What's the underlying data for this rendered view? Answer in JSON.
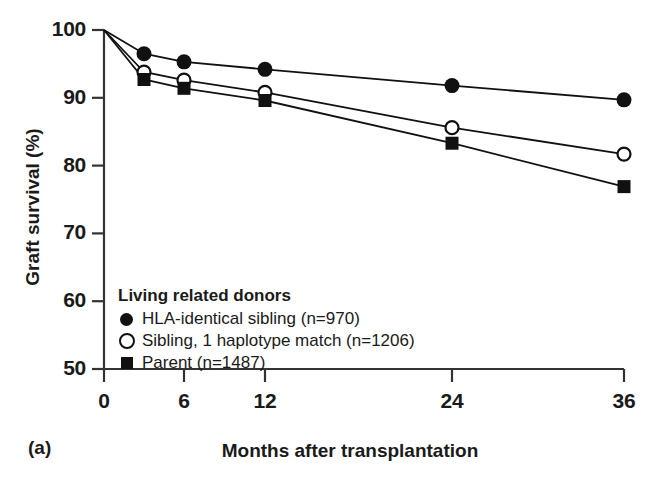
{
  "panel": {
    "label": "(a)"
  },
  "axes": {
    "ylabel": "Graft survival (%)",
    "xlabel": "Months after transplantation",
    "yticks": [
      "100",
      "90",
      "80",
      "70",
      "60",
      "50"
    ],
    "ytick_values": [
      100,
      90,
      80,
      70,
      60,
      50
    ],
    "xticks": [
      "0",
      "6",
      "12",
      "24",
      "36"
    ],
    "xtick_values": [
      0,
      6,
      12,
      24,
      36
    ]
  },
  "legend": {
    "title": "Living related donors",
    "items": [
      {
        "marker": "filled-circle-marker",
        "label": "HLA-identical sibling (n=970)"
      },
      {
        "marker": "open-circle-marker",
        "label": "Sibling, 1 haplotype match (n=1206)"
      },
      {
        "marker": "filled-square-marker",
        "label": "Parent (n=1487)"
      }
    ]
  },
  "colors": {
    "ink": "#111111",
    "background": "#ffffff"
  },
  "chart_data": {
    "type": "line",
    "title": "",
    "subtitle": "",
    "xlabel": "Months after transplantation",
    "ylabel": "Graft survival (%)",
    "xlim": [
      0,
      36
    ],
    "ylim": [
      50,
      100
    ],
    "xticks": [
      0,
      6,
      12,
      24,
      36
    ],
    "yticks": [
      50,
      60,
      70,
      80,
      90,
      100
    ],
    "grid": false,
    "legend_position": "inside-lower-left",
    "legend_title": "Living related donors",
    "x": [
      0,
      3,
      6,
      12,
      24,
      36
    ],
    "series": [
      {
        "name": "HLA-identical sibling (n=970)",
        "marker": "filled-circle",
        "values": [
          100,
          96.5,
          95.3,
          94.2,
          91.8,
          89.7
        ]
      },
      {
        "name": "Sibling, 1 haplotype match (n=1206)",
        "marker": "open-circle",
        "values": [
          100,
          93.8,
          92.6,
          90.8,
          85.6,
          81.7
        ]
      },
      {
        "name": "Parent (n=1487)",
        "marker": "filled-square",
        "values": [
          100,
          92.7,
          91.4,
          89.6,
          83.3,
          76.9
        ]
      }
    ]
  }
}
